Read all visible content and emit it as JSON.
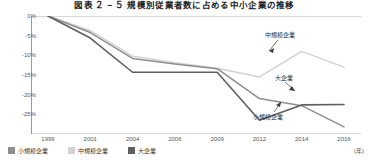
{
  "chart_data": {
    "type": "line",
    "title": "図表 ２ − ５ 規模別従業者数に占める中小企業の推移",
    "title_label": "図表",
    "title_number": "２－５",
    "subtitle": "",
    "xlabel": "",
    "ylabel": "",
    "unit_note": "(年)",
    "x": [
      "1999",
      "2001",
      "2004",
      "2006",
      "2009",
      "2012",
      "2014",
      "2016"
    ],
    "categories": [
      "1999",
      "2001",
      "2004",
      "2006",
      "2009",
      "2012",
      "2014",
      "2016"
    ],
    "ylim": [
      -30,
      0
    ],
    "xlim": [
      "1999",
      "2016"
    ],
    "y_ticks": [
      "0%",
      "-5%",
      "-10%",
      "-15%",
      "-20%",
      "-25%"
    ],
    "y_tick_values": [
      0,
      -5,
      -10,
      -15,
      -20,
      -25
    ],
    "grid": false,
    "legend_position": "bottom-left",
    "series": [
      {
        "name": "小規模企業",
        "color": "#8e8e8e",
        "values": [
          0,
          -4.2,
          -10.8,
          -12.2,
          -13.4,
          -21.0,
          -22.8,
          -28.2
        ]
      },
      {
        "name": "中規模企業",
        "color": "#d2d2d2",
        "values": [
          0,
          -3.7,
          -10.2,
          -11.9,
          -13.3,
          -15.5,
          -9.0,
          -13.0
        ]
      },
      {
        "name": "大企業",
        "color": "#5f5f5f",
        "values": [
          0,
          -5.6,
          -14.3,
          -14.3,
          -14.3,
          -26.5,
          -22.6,
          -22.5
        ]
      }
    ],
    "annotations": [
      {
        "text": "中規模企業",
        "series": "中規模企業"
      },
      {
        "text": "大企業",
        "series": "大企業"
      },
      {
        "text": "小規模企業",
        "series": "小規模企業"
      }
    ]
  },
  "legend": {
    "items": [
      {
        "label": "小規模企業",
        "color": "#8e8e8e"
      },
      {
        "label": "中規模企業",
        "color": "#d2d2d2"
      },
      {
        "label": "大企業",
        "color": "#5f5f5f"
      }
    ]
  },
  "axis": {
    "unit": "(年)"
  },
  "colors": {
    "small": "#8e8e8e",
    "medium": "#d2d2d2",
    "large": "#5f5f5f",
    "axis": "#9a9a9a",
    "text": "#3b3b3b"
  }
}
